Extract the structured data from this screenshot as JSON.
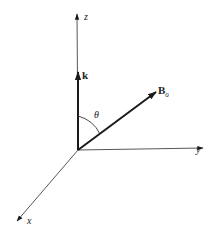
{
  "diagram": {
    "type": "3d-coordinate-axes",
    "colors": {
      "stroke": "#1a1a1a",
      "axis": "#333333",
      "text": "#222222",
      "background": "#ffffff"
    },
    "origin": {
      "x": 78,
      "y": 150
    },
    "axes": {
      "z": {
        "label": "z",
        "tip": {
          "x": 77,
          "y": 13
        }
      },
      "y": {
        "label": "y",
        "tip": {
          "x": 204,
          "y": 148
        }
      },
      "x": {
        "label": "x",
        "tip": {
          "x": 16,
          "y": 222
        }
      }
    },
    "vectors": {
      "k": {
        "label": "k",
        "tip": {
          "x": 78,
          "y": 70
        }
      },
      "B0": {
        "label": "B",
        "subscript": "0",
        "tip": {
          "x": 157,
          "y": 91
        }
      }
    },
    "angle": {
      "label": "θ",
      "between": [
        "k",
        "B0"
      ]
    }
  }
}
